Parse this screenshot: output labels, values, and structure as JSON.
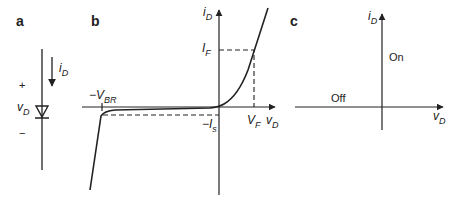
{
  "panels": {
    "a": {
      "label": "a",
      "current_label": "i",
      "current_sub": "D",
      "plus": "+",
      "minus": "−",
      "voltage_label": "v",
      "voltage_sub": "D"
    },
    "b": {
      "label": "b",
      "y_axis_label": "i",
      "y_axis_sub": "D",
      "x_axis_label": "v",
      "x_axis_sub": "D",
      "if_label": "I",
      "if_sub": "F",
      "vf_label": "V",
      "vf_sub": "F",
      "vbr_label": "−V",
      "vbr_sub": "BR",
      "is_label": "−I",
      "is_sub": "s"
    },
    "c": {
      "label": "c",
      "y_axis_label": "i",
      "y_axis_sub": "D",
      "x_axis_label": "v",
      "x_axis_sub": "D",
      "on_label": "On",
      "off_label": "Off"
    }
  },
  "colors": {
    "ink": "#222222",
    "background": "#ffffff"
  }
}
